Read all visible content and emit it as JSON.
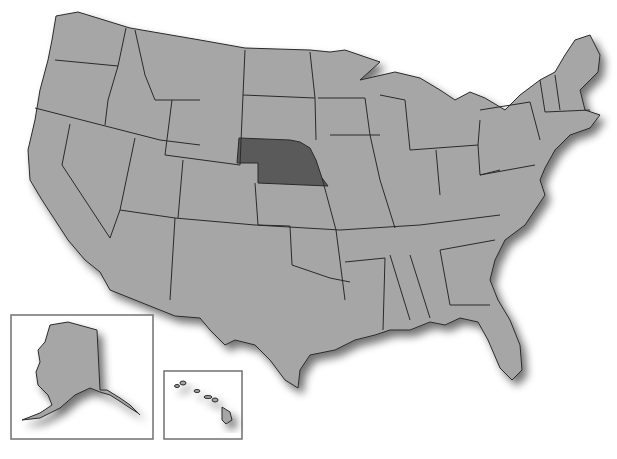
{
  "map": {
    "title": "United States map",
    "highlighted_state": "Nebraska",
    "colors": {
      "background": "#ffffff",
      "state_fill": "#a6a6a6",
      "highlight_fill": "#5a5a5a",
      "border": "#2a2a2a",
      "inset_border": "#707070"
    },
    "insets": [
      {
        "label": "Alaska"
      },
      {
        "label": "Hawaii"
      }
    ]
  }
}
